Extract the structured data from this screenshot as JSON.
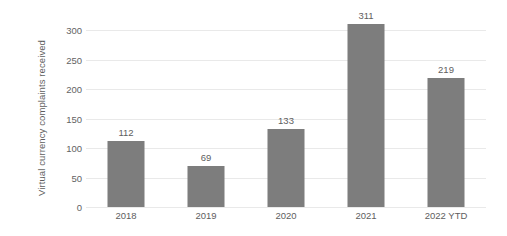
{
  "chart_data": {
    "type": "bar",
    "title": "",
    "subtitle": "",
    "xlabel": "",
    "ylabel": "Virtual currency complaints received",
    "categories": [
      "2018",
      "2019",
      "2020",
      "2021",
      "2022 YTD"
    ],
    "values": [
      112,
      69,
      133,
      311,
      219
    ],
    "value_labels": [
      "112",
      "69",
      "133",
      "311",
      "219"
    ],
    "ylim": [
      0,
      300
    ],
    "yticks": [
      0,
      50,
      100,
      150,
      200,
      250,
      300
    ],
    "ytick_labels": [
      "0",
      "50",
      "100",
      "150",
      "200",
      "250",
      "300"
    ],
    "grid": "horizontal",
    "legend": "none",
    "bar_color": "#7d7d7d",
    "gridline_color": "#e9e9e9",
    "background_color": "#ffffff",
    "text_color": "#5e5e5e"
  }
}
